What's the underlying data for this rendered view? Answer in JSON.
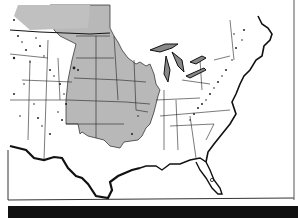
{
  "map": {
    "title": "",
    "colors": {
      "background": "#ffffff",
      "shaded_region": "#b8b8b8",
      "lines": "#111111",
      "mountain_stipple": "#222222",
      "band": "#111111"
    },
    "regions": {
      "shaded": "Central plains and Midwest states (gray)",
      "unshaded": "Western mountain states and Eastern states (white)"
    },
    "features": [
      "state-boundaries",
      "great-lakes",
      "mountain-stipple-west",
      "appalachian-stipple",
      "florida",
      "texas-gulf-coast"
    ]
  }
}
